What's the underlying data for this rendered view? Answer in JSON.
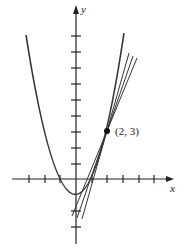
{
  "figure": {
    "x_axis_label": "x",
    "y_axis_label": "y",
    "point_label": "(2, 3)",
    "curve": "y = x^2 - 1",
    "point": {
      "x": 2,
      "y": 3
    },
    "x_ticks": [
      -3,
      -2,
      -1,
      1,
      2,
      3,
      4,
      5,
      6
    ],
    "y_ticks": [
      -3,
      -2,
      -1,
      1,
      2,
      3,
      4,
      5,
      6,
      7,
      8,
      9
    ],
    "lines": [
      {
        "name": "secant-1",
        "description": "line through (2, 3) approaching tangent"
      },
      {
        "name": "secant-2",
        "description": "line through (2, 3) approaching tangent"
      },
      {
        "name": "secant-3",
        "description": "line through (2, 3) approaching tangent"
      }
    ],
    "colors": {
      "stroke": "#222222",
      "background": "#ffffff"
    }
  }
}
